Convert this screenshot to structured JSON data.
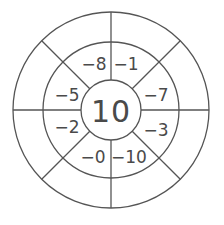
{
  "diagram": {
    "type": "number-wheel",
    "center_value": "10",
    "colors": {
      "stroke": "#555555",
      "text": "#4a4a4a",
      "background": "#ffffff"
    },
    "sectors": [
      {
        "position": "top-left",
        "label": "−8"
      },
      {
        "position": "top-right",
        "label": "−1"
      },
      {
        "position": "right-top",
        "label": "−7"
      },
      {
        "position": "right-bottom",
        "label": "−3"
      },
      {
        "position": "bottom-right",
        "label": "−10"
      },
      {
        "position": "bottom-left",
        "label": "−0"
      },
      {
        "position": "left-bottom",
        "label": "−2"
      },
      {
        "position": "left-top",
        "label": "−5"
      }
    ],
    "outer_ring_answers": [
      "",
      "",
      "",
      "",
      "",
      "",
      "",
      ""
    ]
  }
}
